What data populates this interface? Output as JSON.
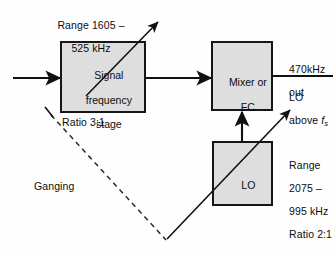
{
  "diagram": {
    "colors": {
      "block_fill": "#dedede",
      "stroke": "#161616",
      "background": "#ffffff"
    },
    "blocks": {
      "signal_stage": {
        "label_line1": "Signal",
        "label_line2": "frequency",
        "label_line3": "stage"
      },
      "mixer": {
        "label_line1": "Mixer or",
        "label_line2": "FC"
      },
      "lo": {
        "label": "LO"
      }
    },
    "annotations": {
      "signal_range_line1": "Range 1605 –",
      "signal_range_line2": "525 kHz",
      "signal_ratio": "Ratio 3:1",
      "ganging": "Ganging",
      "output_if_line1": "470kHz",
      "output_if_line2": "out",
      "lo_relation_line1": "LO",
      "lo_relation_line2_prefix": "above ",
      "lo_relation_line2_symbol": "f",
      "lo_relation_line2_subscript": "s",
      "lo_range_line1": "Range",
      "lo_range_line2": "2075 –",
      "lo_range_line3": "995 kHz",
      "lo_ratio": "Ratio 2:1"
    }
  }
}
